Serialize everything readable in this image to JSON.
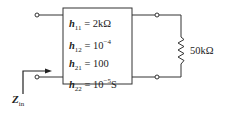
{
  "two_port": {
    "params": [
      {
        "name": "h",
        "sub": "11",
        "eq": " = ",
        "value": "2kΩ",
        "exp": "",
        "unit": ""
      },
      {
        "name": "h",
        "sub": "12",
        "eq": " = ",
        "value": "10",
        "exp": "−4",
        "unit": ""
      },
      {
        "name": "h",
        "sub": "21",
        "eq": " = ",
        "value": "100",
        "exp": "",
        "unit": ""
      },
      {
        "name": "h",
        "sub": "22",
        "eq": " = ",
        "value": "10",
        "exp": "−5",
        "unit": "S"
      }
    ]
  },
  "load": {
    "label": "50kΩ"
  },
  "input": {
    "label": "Z",
    "sub": "in"
  }
}
